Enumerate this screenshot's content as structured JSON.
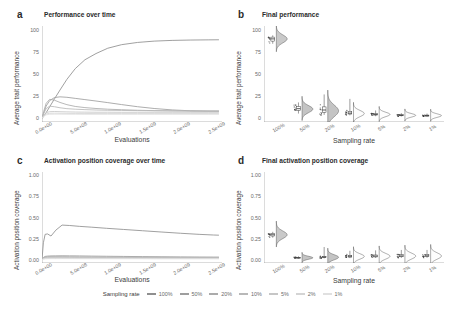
{
  "figure": {
    "legend_title": "Sampling rate",
    "sampling_rates": [
      "100%",
      "50%",
      "20%",
      "10%",
      "5%",
      "2%",
      "1%"
    ],
    "series_colors": [
      "#8f8f8f",
      "#9e9e9e",
      "#ababab",
      "#b8b8b8",
      "#c6c6c6",
      "#d4d4d4",
      "#e0e0e0"
    ]
  },
  "panels": {
    "a": {
      "tag": "a",
      "title": "Performance over time"
    },
    "b": {
      "tag": "b",
      "title": "Final performance"
    },
    "c": {
      "tag": "c",
      "title": "Activation position coverage over time"
    },
    "d": {
      "tag": "d",
      "title": "Final activation position coverage"
    }
  },
  "chart_data": [
    {
      "id": "a",
      "type": "line",
      "title": "Performance over time",
      "xlabel": "Evaluations",
      "ylabel": "Average trait performance",
      "xlim": [
        0,
        2600000000
      ],
      "ylim": [
        -4,
        104
      ],
      "xticks": [
        0,
        500000000,
        1000000000,
        1500000000,
        2000000000,
        2500000000
      ],
      "xticklabels": [
        "0.0e+00",
        "5.0e+08",
        "1.0e+09",
        "1.5e+09",
        "2.0e+09",
        "2.5e+09"
      ],
      "yticks": [
        0,
        25,
        50,
        75,
        100
      ],
      "yticklabels": [
        "0",
        "25",
        "50",
        "75",
        "100"
      ],
      "grid": false,
      "legend": "bottom",
      "x": [
        0,
        25000000,
        60000000,
        110000000,
        180000000,
        260000000,
        360000000,
        480000000,
        620000000,
        780000000,
        950000000,
        1150000000,
        1380000000,
        1620000000,
        1880000000,
        2150000000,
        2400000000,
        2550000000
      ],
      "series": [
        {
          "name": "100%",
          "values": [
            0,
            2.5,
            6.5,
            13,
            22,
            32,
            44,
            56,
            66,
            73,
            79,
            83,
            85.5,
            87,
            87.8,
            88.2,
            88.4,
            88.5
          ]
        },
        {
          "name": "50%",
          "values": [
            0,
            6,
            14,
            20,
            23.5,
            24.3,
            23.8,
            22.6,
            21.2,
            19.6,
            17.8,
            15.6,
            13.2,
            11.2,
            9.6,
            8.6,
            8.2,
            8.1
          ]
        },
        {
          "name": "20%",
          "values": [
            0,
            8,
            17,
            21.5,
            20.5,
            18,
            15.5,
            13.5,
            12.2,
            11.2,
            10.4,
            9.8,
            9.2,
            8.8,
            8.5,
            8.3,
            8.2,
            8.2
          ]
        },
        {
          "name": "10%",
          "values": [
            0,
            5.5,
            11,
            13.8,
            13.2,
            12,
            11,
            10.4,
            9.9,
            9.5,
            9.2,
            9.0,
            8.8,
            8.6,
            8.5,
            8.4,
            8.4,
            8.4
          ]
        },
        {
          "name": "5%",
          "values": [
            0,
            3.5,
            6.5,
            7.6,
            7.8,
            7.6,
            7.4,
            7.2,
            7.1,
            7.0,
            7.0,
            6.9,
            6.9,
            6.9,
            6.9,
            6.9,
            6.9,
            6.9
          ]
        },
        {
          "name": "2%",
          "values": [
            0,
            2.8,
            5.0,
            5.8,
            5.9,
            5.8,
            5.7,
            5.6,
            5.6,
            5.5,
            5.5,
            5.5,
            5.5,
            5.5,
            5.5,
            5.5,
            5.5,
            5.5
          ]
        },
        {
          "name": "1%",
          "values": [
            0,
            2.2,
            4.0,
            4.7,
            4.8,
            4.8,
            4.7,
            4.7,
            4.6,
            4.6,
            4.6,
            4.6,
            4.6,
            4.6,
            4.6,
            4.6,
            4.6,
            4.6
          ]
        }
      ]
    },
    {
      "id": "b",
      "type": "raincloud",
      "title": "Final performance",
      "xlabel": "Sampling rate",
      "ylabel": "Average trait performance",
      "ylim": [
        -4,
        104
      ],
      "yticks": [
        0,
        25,
        50,
        75,
        100
      ],
      "yticklabels": [
        "0",
        "25",
        "50",
        "75",
        "100"
      ],
      "categories": [
        "100%",
        "50%",
        "20%",
        "10%",
        "5%",
        "2%",
        "1%"
      ],
      "grid": false,
      "groups": [
        {
          "name": "100%",
          "median": 89.5,
          "q1": 87.0,
          "q3": 91.5,
          "whisker_low": 84.0,
          "whisker_high": 93.5,
          "density_peak": 89.5,
          "density_spread": 4.5
        },
        {
          "name": "50%",
          "median": 11.0,
          "q1": 9.0,
          "q3": 13.5,
          "whisker_low": 5.5,
          "whisker_high": 18.0,
          "density_peak": 10.5,
          "density_spread": 4.0
        },
        {
          "name": "20%",
          "median": 9.5,
          "q1": 7.0,
          "q3": 13.0,
          "whisker_low": 4.0,
          "whisker_high": 27.0,
          "density_peak": 8.5,
          "density_spread": 6.5
        },
        {
          "name": "10%",
          "median": 6.0,
          "q1": 5.0,
          "q3": 8.0,
          "whisker_low": 3.5,
          "whisker_high": 22.0,
          "density_peak": 5.5,
          "density_spread": 3.5
        },
        {
          "name": "5%",
          "median": 4.5,
          "q1": 3.8,
          "q3": 5.5,
          "whisker_low": 2.5,
          "whisker_high": 9.0,
          "density_peak": 4.5,
          "density_spread": 2.5
        },
        {
          "name": "2%",
          "median": 3.5,
          "q1": 3.0,
          "q3": 4.2,
          "whisker_low": 2.2,
          "whisker_high": 6.0,
          "density_peak": 3.5,
          "density_spread": 2.0
        },
        {
          "name": "1%",
          "median": 3.2,
          "q1": 2.6,
          "q3": 3.8,
          "whisker_low": 2.0,
          "whisker_high": 5.5,
          "density_peak": 3.2,
          "density_spread": 2.0
        }
      ]
    },
    {
      "id": "c",
      "type": "line",
      "title": "Activation position coverage over time",
      "xlabel": "Evaluations",
      "ylabel": "Activation position coverage",
      "xlim": [
        0,
        2600000000
      ],
      "ylim": [
        -0.04,
        1.04
      ],
      "xticks": [
        0,
        500000000,
        1000000000,
        1500000000,
        2000000000,
        2500000000
      ],
      "xticklabels": [
        "0.0e+00",
        "5.0e+08",
        "1.0e+09",
        "1.5e+09",
        "2.0e+09",
        "2.5e+09"
      ],
      "yticks": [
        0.0,
        0.25,
        0.5,
        0.75,
        1.0
      ],
      "yticklabels": [
        "0.00",
        "0.25",
        "0.50",
        "0.75",
        "1.00"
      ],
      "grid": false,
      "legend": "bottom",
      "x": [
        0,
        20000000,
        45000000,
        80000000,
        130000000,
        200000000,
        290000000,
        400000000,
        540000000,
        720000000,
        930000000,
        1180000000,
        1450000000,
        1720000000,
        2000000000,
        2270000000,
        2480000000,
        2550000000
      ],
      "series": [
        {
          "name": "100%",
          "values": [
            0.0,
            0.2,
            0.3,
            0.305,
            0.28,
            0.35,
            0.41,
            0.405,
            0.395,
            0.385,
            0.372,
            0.358,
            0.343,
            0.328,
            0.313,
            0.3,
            0.292,
            0.29
          ]
        },
        {
          "name": "50%",
          "values": [
            0.0,
            0.025,
            0.038,
            0.042,
            0.044,
            0.045,
            0.046,
            0.045,
            0.044,
            0.042,
            0.04,
            0.038,
            0.036,
            0.034,
            0.032,
            0.031,
            0.03,
            0.03
          ]
        },
        {
          "name": "20%",
          "values": [
            0.0,
            0.02,
            0.03,
            0.034,
            0.035,
            0.035,
            0.035,
            0.034,
            0.033,
            0.032,
            0.031,
            0.03,
            0.029,
            0.028,
            0.027,
            0.026,
            0.026,
            0.026
          ]
        },
        {
          "name": "10%",
          "values": [
            0.0,
            0.016,
            0.024,
            0.027,
            0.028,
            0.028,
            0.028,
            0.027,
            0.026,
            0.026,
            0.025,
            0.024,
            0.024,
            0.023,
            0.023,
            0.022,
            0.022,
            0.022
          ]
        },
        {
          "name": "5%",
          "values": [
            0.0,
            0.012,
            0.018,
            0.02,
            0.021,
            0.021,
            0.021,
            0.02,
            0.02,
            0.019,
            0.019,
            0.019,
            0.018,
            0.018,
            0.018,
            0.017,
            0.017,
            0.017
          ]
        },
        {
          "name": "2%",
          "values": [
            0.0,
            0.009,
            0.013,
            0.015,
            0.015,
            0.015,
            0.015,
            0.015,
            0.014,
            0.014,
            0.014,
            0.014,
            0.013,
            0.013,
            0.013,
            0.013,
            0.013,
            0.013
          ]
        },
        {
          "name": "1%",
          "values": [
            0.0,
            0.007,
            0.01,
            0.011,
            0.012,
            0.012,
            0.012,
            0.012,
            0.011,
            0.011,
            0.011,
            0.011,
            0.011,
            0.01,
            0.01,
            0.01,
            0.01,
            0.01
          ]
        }
      ]
    },
    {
      "id": "d",
      "type": "raincloud",
      "title": "Final activation position coverage",
      "xlabel": "Sampling rate",
      "ylabel": "Activation position coverage",
      "ylim": [
        -0.04,
        1.04
      ],
      "yticks": [
        0.0,
        0.25,
        0.5,
        0.75,
        1.0
      ],
      "yticklabels": [
        "0.00",
        "0.25",
        "0.50",
        "0.75",
        "1.00"
      ],
      "categories": [
        "100%",
        "50%",
        "20%",
        "10%",
        "5%",
        "2%",
        "1%"
      ],
      "grid": false,
      "groups": [
        {
          "name": "100%",
          "median": 0.295,
          "q1": 0.28,
          "q3": 0.31,
          "whisker_low": 0.26,
          "whisker_high": 0.33,
          "density_peak": 0.295,
          "density_spread": 0.045
        },
        {
          "name": "50%",
          "median": 0.022,
          "q1": 0.018,
          "q3": 0.028,
          "whisker_low": 0.012,
          "whisker_high": 0.04,
          "density_peak": 0.022,
          "density_spread": 0.018
        },
        {
          "name": "20%",
          "median": 0.03,
          "q1": 0.024,
          "q3": 0.038,
          "whisker_low": 0.015,
          "whisker_high": 0.15,
          "density_peak": 0.028,
          "density_spread": 0.03
        },
        {
          "name": "10%",
          "median": 0.04,
          "q1": 0.03,
          "q3": 0.052,
          "whisker_low": 0.018,
          "whisker_high": 0.105,
          "density_peak": 0.038,
          "density_spread": 0.032
        },
        {
          "name": "5%",
          "median": 0.042,
          "q1": 0.032,
          "q3": 0.055,
          "whisker_low": 0.02,
          "whisker_high": 0.11,
          "density_peak": 0.04,
          "density_spread": 0.034
        },
        {
          "name": "2%",
          "median": 0.044,
          "q1": 0.034,
          "q3": 0.058,
          "whisker_low": 0.02,
          "whisker_high": 0.115,
          "density_peak": 0.042,
          "density_spread": 0.036
        },
        {
          "name": "1%",
          "median": 0.045,
          "q1": 0.035,
          "q3": 0.06,
          "whisker_low": 0.022,
          "whisker_high": 0.115,
          "density_peak": 0.043,
          "density_spread": 0.038
        }
      ]
    }
  ]
}
